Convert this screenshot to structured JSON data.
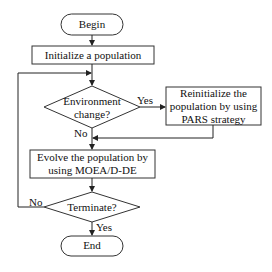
{
  "diagram": {
    "nodes": {
      "begin": {
        "label": "Begin",
        "shape": "terminator"
      },
      "init": {
        "label": "Initialize a population",
        "shape": "process"
      },
      "env_change": {
        "label_line1": "Environment",
        "label_line2": "change?",
        "shape": "decision"
      },
      "reinit": {
        "label_line1": "Reinitialize the",
        "label_line2": "population by using",
        "label_line3": "PARS strategy",
        "shape": "process"
      },
      "evolve": {
        "label_line1": "Evolve the population by",
        "label_line2": "using MOEA/D-DE",
        "shape": "process"
      },
      "terminate": {
        "label": "Terminate?",
        "shape": "decision"
      },
      "end": {
        "label": "End",
        "shape": "terminator"
      }
    },
    "edge_labels": {
      "env_yes": "Yes",
      "env_no": "No",
      "term_no": "No",
      "term_yes": "Yes"
    },
    "colors": {
      "stroke": "#333333",
      "fill": "#ffffff",
      "text": "#111111"
    }
  }
}
